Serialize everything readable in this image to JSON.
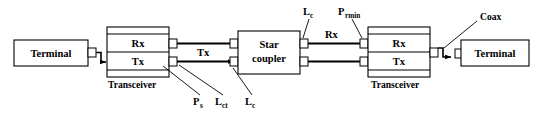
{
  "diagram": {
    "type": "block-diagram",
    "colors": {
      "stroke": "#000000",
      "background": "#ffffff",
      "fill": "#ffffff"
    },
    "blocks": [
      {
        "id": "terminal-left",
        "label": "Terminal",
        "x": 14,
        "y": 40,
        "w": 74,
        "h": 26
      },
      {
        "id": "transceiver-left",
        "label_rx": "Rx",
        "label_tx": "Tx",
        "caption": "Transceiver",
        "x": 107,
        "y": 27,
        "w": 62,
        "h": 50
      },
      {
        "id": "star-coupler",
        "label_line1": "Star",
        "label_line2": "coupler",
        "x": 238,
        "y": 31,
        "w": 62,
        "h": 43
      },
      {
        "id": "transceiver-right",
        "label_rx": "Rx",
        "label_tx": "Tx",
        "caption": "Transceiver",
        "x": 368,
        "y": 27,
        "w": 62,
        "h": 50
      },
      {
        "id": "terminal-right",
        "label": "Terminal",
        "x": 461,
        "y": 40,
        "w": 68,
        "h": 26
      }
    ],
    "captions": {
      "transceiver_left": "Transceiver",
      "transceiver_right": "Transceiver"
    },
    "signal_labels": {
      "tx_left": "Tx",
      "rx_right": "Rx"
    },
    "parameter_labels": [
      {
        "id": "p-s",
        "base": "P",
        "sub": "s",
        "x": 197,
        "y": 103
      },
      {
        "id": "l-ct",
        "base": "L",
        "sub": "ct",
        "x": 220,
        "y": 103
      },
      {
        "id": "l-c-left",
        "base": "L",
        "sub": "c",
        "x": 249,
        "y": 103
      },
      {
        "id": "l-c-top",
        "base": "L",
        "sub": "c",
        "x": 307,
        "y": 14
      },
      {
        "id": "p-rmin",
        "base": "P",
        "sub": "rmin",
        "x": 344,
        "y": 14
      }
    ],
    "annotations": {
      "coax": "Coax"
    },
    "box_labels": {
      "terminal": "Terminal",
      "rx": "Rx",
      "tx": "Tx",
      "star": "Star",
      "coupler": "coupler"
    }
  }
}
